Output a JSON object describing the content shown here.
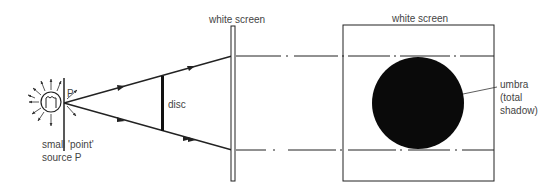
{
  "labels": {
    "screen1": "white screen",
    "screen2": "white screen",
    "point": "P",
    "disc": "disc",
    "source_line1": "small 'point'",
    "source_line2": "source P",
    "umbra_line1": "umbra",
    "umbra_line2": "(total",
    "umbra_line3": "shadow)"
  },
  "colors": {
    "line": "#222222",
    "shadow": "#0a0a0a",
    "text": "#444444"
  }
}
